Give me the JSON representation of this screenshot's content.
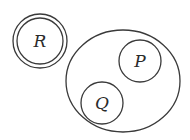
{
  "diagram": {
    "type": "set-diagram",
    "stroke_color": "#3a3a3a",
    "background": "#ffffff",
    "sets": [
      {
        "id": "R",
        "label": "R",
        "shape": "double-circle",
        "cx": 40,
        "cy": 41,
        "r_outer": 27,
        "r_inner": 23
      },
      {
        "id": "U",
        "label": "",
        "shape": "ellipse",
        "cx": 123,
        "cy": 81,
        "rx": 57,
        "ry": 51
      },
      {
        "id": "P",
        "label": "P",
        "shape": "circle",
        "cx": 140,
        "cy": 61,
        "r": 21,
        "inside": "U"
      },
      {
        "id": "Q",
        "label": "Q",
        "shape": "circle",
        "cx": 102,
        "cy": 103,
        "r": 21,
        "inside": "U"
      }
    ],
    "labels": {
      "R": "R",
      "P": "P",
      "Q": "Q"
    }
  }
}
